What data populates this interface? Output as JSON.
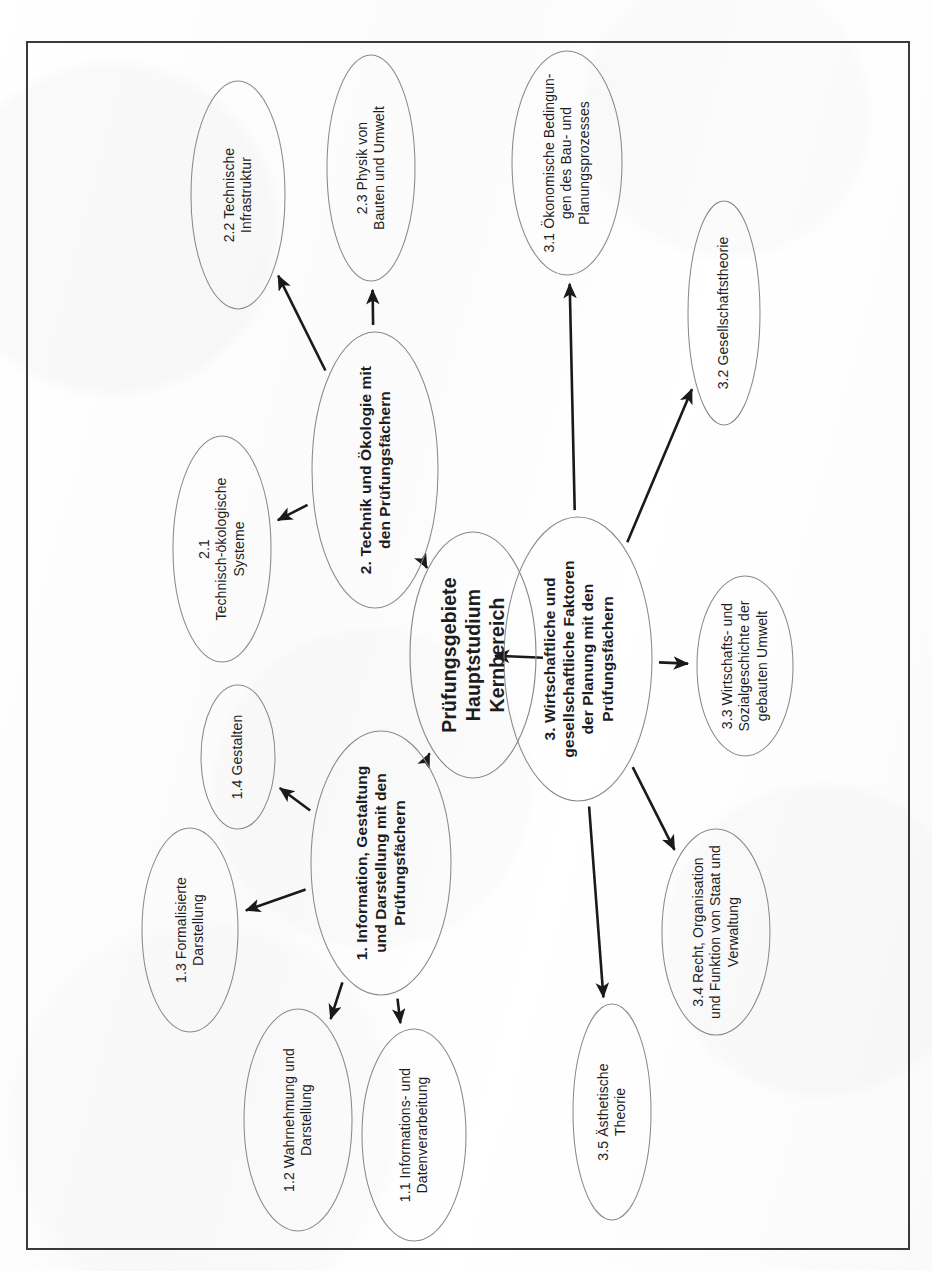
{
  "page": {
    "title": "Prüfungsgebiete Hauptstudium Kernbereich",
    "orientation": "landscape-rotated-90",
    "frame_color": "#3a3a3c",
    "background_color": "#fdfdfd",
    "node_stroke_color": "#8a8a8a",
    "arrow_color": "#1a1a1a",
    "text_color": "#1d1d1f"
  },
  "chart_data": {
    "type": "diagram",
    "subtype": "mind-map",
    "title": "Prüfungsgebiete Hauptstudium Kernbereich",
    "nodes": [
      {
        "id": "root",
        "label": "Prüfungsgebiete\nHauptstudium\nKernbereich",
        "level": 0,
        "cx": 473,
        "cy": 655,
        "rx": 63,
        "ry": 123
      },
      {
        "id": "b1",
        "label": "1. Information, Gestaltung\nund Darstellung mit den\nPrüfungsfächern",
        "level": 1,
        "cx": 381,
        "cy": 863,
        "rx": 70,
        "ry": 132
      },
      {
        "id": "b2",
        "label": "2. Technik und Ökologie mit\nden Prüfungsfächern",
        "level": 1,
        "cx": 375,
        "cy": 470,
        "rx": 63,
        "ry": 138
      },
      {
        "id": "b3",
        "label": "3. Wirtschaftliche und\ngesellschaftliche Faktoren\nder Planung mit den\nPrüfungsfächern",
        "level": 1,
        "cx": 578,
        "cy": 659,
        "rx": 74,
        "ry": 142
      },
      {
        "id": "n11",
        "label": "1.1 Informations- und\nDatenverarbeitung",
        "level": 2,
        "cx": 414,
        "cy": 1135,
        "rx": 52,
        "ry": 106
      },
      {
        "id": "n12",
        "label": "1.2 Wahrnehmung und\nDarstellung",
        "level": 2,
        "cx": 298,
        "cy": 1120,
        "rx": 54,
        "ry": 111
      },
      {
        "id": "n13",
        "label": "1.3 Formalisierte\nDarstellung",
        "level": 2,
        "cx": 190,
        "cy": 930,
        "rx": 48,
        "ry": 102
      },
      {
        "id": "n14",
        "label": "1.4 Gestalten",
        "level": 2,
        "cx": 238,
        "cy": 757,
        "rx": 37,
        "ry": 72
      },
      {
        "id": "n21",
        "label": "2.1\nTechnisch-ökologische\nSysteme",
        "level": 2,
        "cx": 222,
        "cy": 549,
        "rx": 49,
        "ry": 113
      },
      {
        "id": "n22",
        "label": "2.2 Technische\nInfrastruktur",
        "level": 2,
        "cx": 238,
        "cy": 195,
        "rx": 47,
        "ry": 114
      },
      {
        "id": "n23",
        "label": "2.3 Physik von\nBauten und Umwelt",
        "level": 2,
        "cx": 371,
        "cy": 168,
        "rx": 44,
        "ry": 113
      },
      {
        "id": "n31",
        "label": "3.1 Ökonomische Bedingun-\ngen des Bau- und\nPlanungsprozesses",
        "level": 2,
        "cx": 567,
        "cy": 163,
        "rx": 55,
        "ry": 112
      },
      {
        "id": "n32",
        "label": "3.2 Gesellschaftstheorie",
        "level": 2,
        "cx": 724,
        "cy": 313,
        "rx": 36,
        "ry": 112
      },
      {
        "id": "n33",
        "label": "3.3 Wirtschafts- und\nSozialgeschichte der\ngebauten Umwelt",
        "level": 2,
        "cx": 745,
        "cy": 666,
        "rx": 48,
        "ry": 90
      },
      {
        "id": "n34",
        "label": "3.4 Recht, Organisation\nund Funktion von Staat und\nVerwaltung",
        "level": 2,
        "cx": 716,
        "cy": 932,
        "rx": 54,
        "ry": 103
      },
      {
        "id": "n35",
        "label": "3.5 Ästhetische\nTheorie",
        "level": 2,
        "cx": 612,
        "cy": 1112,
        "rx": 39,
        "ry": 108
      }
    ],
    "edges": [
      {
        "from": "root",
        "to": "b2",
        "style": "arrow"
      },
      {
        "from": "root",
        "to": "b3",
        "style": "arrow"
      },
      {
        "from": "root",
        "to": "b1",
        "style": "arrow"
      },
      {
        "from": "b2",
        "to": "n22",
        "style": "arrow"
      },
      {
        "from": "b2",
        "to": "n23",
        "style": "arrow"
      },
      {
        "from": "b2",
        "to": "n21",
        "style": "arrow"
      },
      {
        "from": "b1",
        "to": "n14",
        "style": "arrow"
      },
      {
        "from": "b1",
        "to": "n13",
        "style": "arrow"
      },
      {
        "from": "b1",
        "to": "n12",
        "style": "arrow"
      },
      {
        "from": "b1",
        "to": "n11",
        "style": "arrow"
      },
      {
        "from": "b3",
        "to": "n31",
        "style": "arrow"
      },
      {
        "from": "b3",
        "to": "n32",
        "style": "arrow"
      },
      {
        "from": "b3",
        "to": "n33",
        "style": "arrow"
      },
      {
        "from": "b3",
        "to": "n34",
        "style": "arrow"
      },
      {
        "from": "b3",
        "to": "n35",
        "style": "arrow"
      }
    ]
  }
}
